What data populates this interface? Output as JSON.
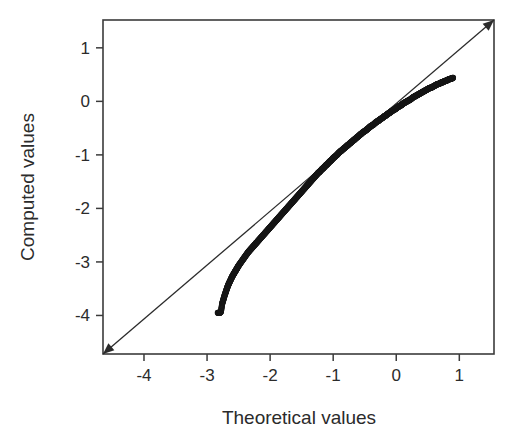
{
  "figure": {
    "background_color": "#ffffff",
    "frame_color": "#3b3b3b",
    "marker_color": "#161616",
    "reference_line_color": "#2b2b2b"
  },
  "chart_data": {
    "type": "scatter",
    "title": "",
    "subtitle": "",
    "xlabel": "Theoretical values",
    "ylabel": "Computed values",
    "xlim": [
      -4.65,
      1.55
    ],
    "ylim": [
      -4.72,
      1.52
    ],
    "xticks": [
      -4,
      -3,
      -2,
      -1,
      0,
      1
    ],
    "xticklabels": [
      "-4",
      "-3",
      "-2",
      "-1",
      "0",
      "1"
    ],
    "yticks": [
      1,
      0,
      -1,
      -2,
      -3,
      -4
    ],
    "yticklabels": [
      "1",
      "0",
      "-1",
      "-2",
      "-3",
      "-4"
    ],
    "grid": false,
    "legend": null,
    "legend_position": "none",
    "marker_style": "open-circle",
    "annotations": [
      {
        "name": "reference-line",
        "label": "y = x identity line",
        "from": [
          -4.65,
          -4.72
        ],
        "to": [
          1.55,
          1.52
        ],
        "arrowheads": "both"
      }
    ],
    "series": [
      {
        "name": "Q-Q sample quantiles",
        "x": [
          -2.83,
          -2.8,
          -2.78,
          -2.76,
          -2.74,
          -2.72,
          -2.7,
          -2.68,
          -2.66,
          -2.64,
          -2.62,
          -2.6,
          -2.58,
          -2.56,
          -2.54,
          -2.52,
          -2.5,
          -2.47,
          -2.44,
          -2.41,
          -2.38,
          -2.35,
          -2.32,
          -2.29,
          -2.26,
          -2.23,
          -2.2,
          -2.17,
          -2.14,
          -2.11,
          -2.08,
          -2.05,
          -2.02,
          -1.99,
          -1.96,
          -1.93,
          -1.9,
          -1.87,
          -1.84,
          -1.81,
          -1.78,
          -1.75,
          -1.72,
          -1.69,
          -1.66,
          -1.63,
          -1.6,
          -1.57,
          -1.54,
          -1.51,
          -1.48,
          -1.45,
          -1.42,
          -1.39,
          -1.36,
          -1.33,
          -1.3,
          -1.27,
          -1.24,
          -1.21,
          -1.18,
          -1.15,
          -1.12,
          -1.09,
          -1.06,
          -1.03,
          -1.0,
          -0.97,
          -0.94,
          -0.91,
          -0.88,
          -0.85,
          -0.82,
          -0.79,
          -0.76,
          -0.73,
          -0.7,
          -0.67,
          -0.64,
          -0.61,
          -0.58,
          -0.55,
          -0.52,
          -0.49,
          -0.46,
          -0.43,
          -0.4,
          -0.37,
          -0.34,
          -0.31,
          -0.28,
          -0.25,
          -0.22,
          -0.19,
          -0.16,
          -0.13,
          -0.1,
          -0.07,
          -0.04,
          -0.01,
          0.02,
          0.05,
          0.08,
          0.11,
          0.14,
          0.17,
          0.2,
          0.23,
          0.26,
          0.29,
          0.32,
          0.35,
          0.38,
          0.41,
          0.44,
          0.47,
          0.5,
          0.53,
          0.56,
          0.59,
          0.62,
          0.65,
          0.68,
          0.71,
          0.74,
          0.77,
          0.8,
          0.83,
          0.86,
          0.88,
          0.9
        ],
        "y": [
          -3.95,
          -3.95,
          -3.93,
          -3.78,
          -3.7,
          -3.62,
          -3.55,
          -3.48,
          -3.42,
          -3.37,
          -3.32,
          -3.27,
          -3.23,
          -3.19,
          -3.15,
          -3.11,
          -3.07,
          -3.02,
          -2.97,
          -2.92,
          -2.87,
          -2.82,
          -2.78,
          -2.74,
          -2.7,
          -2.66,
          -2.62,
          -2.58,
          -2.54,
          -2.5,
          -2.46,
          -2.42,
          -2.38,
          -2.34,
          -2.3,
          -2.26,
          -2.22,
          -2.18,
          -2.14,
          -2.1,
          -2.06,
          -2.02,
          -1.98,
          -1.94,
          -1.9,
          -1.86,
          -1.82,
          -1.78,
          -1.74,
          -1.7,
          -1.66,
          -1.62,
          -1.58,
          -1.54,
          -1.5,
          -1.46,
          -1.42,
          -1.38,
          -1.34,
          -1.31,
          -1.27,
          -1.24,
          -1.2,
          -1.17,
          -1.13,
          -1.1,
          -1.06,
          -1.03,
          -1.0,
          -0.96,
          -0.93,
          -0.9,
          -0.87,
          -0.84,
          -0.81,
          -0.78,
          -0.75,
          -0.72,
          -0.69,
          -0.66,
          -0.63,
          -0.6,
          -0.57,
          -0.55,
          -0.52,
          -0.49,
          -0.46,
          -0.44,
          -0.41,
          -0.38,
          -0.36,
          -0.33,
          -0.31,
          -0.28,
          -0.26,
          -0.23,
          -0.21,
          -0.18,
          -0.16,
          -0.14,
          -0.11,
          -0.09,
          -0.07,
          -0.04,
          -0.02,
          0.0,
          0.02,
          0.04,
          0.07,
          0.09,
          0.11,
          0.13,
          0.15,
          0.17,
          0.19,
          0.21,
          0.23,
          0.25,
          0.26,
          0.28,
          0.3,
          0.32,
          0.33,
          0.35,
          0.36,
          0.38,
          0.39,
          0.41,
          0.42,
          0.43,
          0.44
        ]
      }
    ]
  }
}
